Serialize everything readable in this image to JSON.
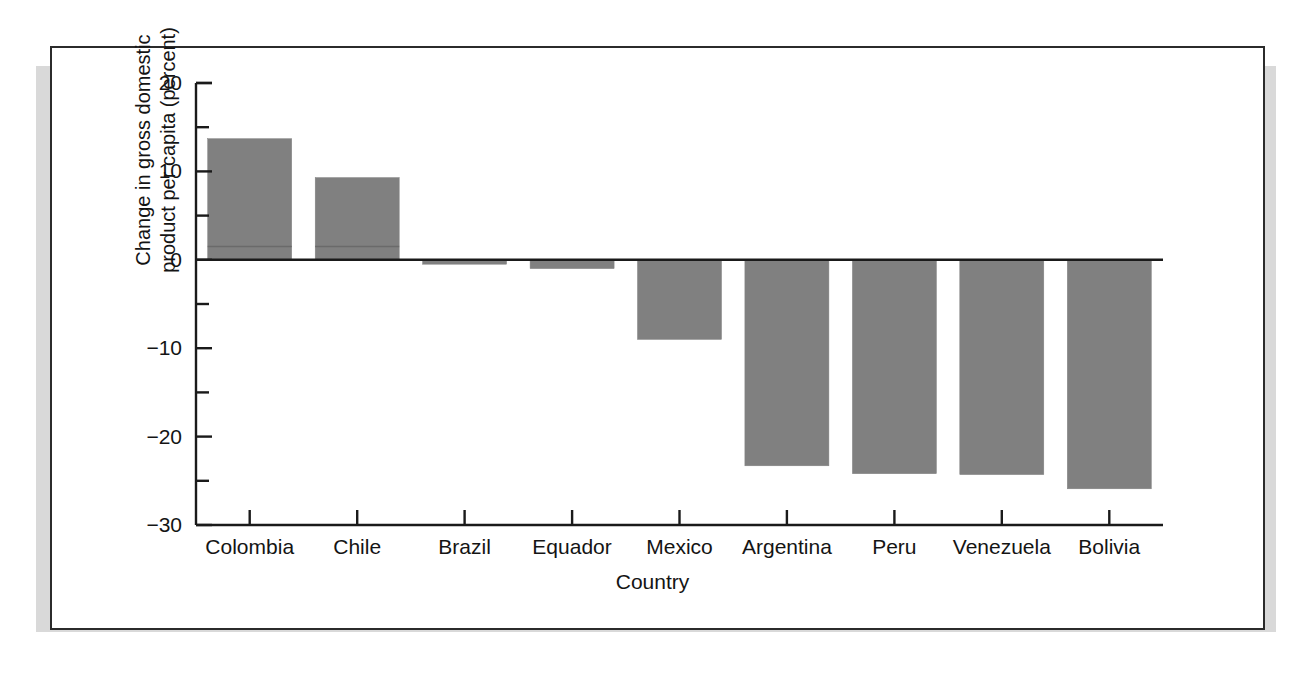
{
  "figure": {
    "background": "#ffffff",
    "frame_color": "#2b2b2b",
    "shadow_color": "#d9d9d9"
  },
  "chart_data": {
    "type": "bar",
    "title": "",
    "xlabel": "Country",
    "ylabel": "Change in gross domestic product per capita (percent)",
    "ylabel_line1": "Change in gross domestic",
    "ylabel_line2": "product per capita (percent)",
    "categories": [
      "Colombia",
      "Chile",
      "Brazil",
      "Equador",
      "Mexico",
      "Argentina",
      "Peru",
      "Venezuela",
      "Bolivia"
    ],
    "values": [
      13.7,
      9.3,
      -0.5,
      -1.0,
      -9.0,
      -23.3,
      -24.2,
      -24.3,
      -25.9
    ],
    "ylim": [
      -30,
      20
    ],
    "yticks": [
      20,
      10,
      0,
      -10,
      -20,
      -30
    ],
    "ytick_labels": [
      "20",
      "10",
      "0",
      "−10",
      "−20",
      "−30"
    ],
    "yminor_ticks": [
      15,
      5,
      -5,
      -15,
      -25
    ],
    "ytick_interval_major": 10,
    "ytick_interval_minor": 5,
    "grid": false,
    "legend": null,
    "bar_color": "#808080",
    "bar_edge_color": "#808080",
    "axis_color": "#1a1a1a",
    "zero_line_value": 0,
    "bar_inner_line_value": 1.5
  }
}
